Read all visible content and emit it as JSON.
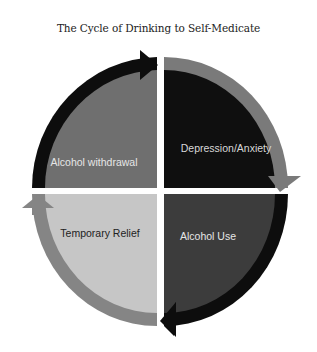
{
  "title": "The Cycle of Drinking to Self-Medicate",
  "quadrants": [
    {
      "position": "top-left",
      "label": "Alcohol withdrawal",
      "fill": "#6f6f6f",
      "text_color": "#e6e6e6",
      "arc_color": "#0d0d0d"
    },
    {
      "position": "top-right",
      "label": "Depression/Anxiety",
      "fill": "#0f0f0f",
      "text_color": "#d8d8d8",
      "arc_color": "#7a7a7a"
    },
    {
      "position": "bottom-right",
      "label": "Alcohol Use",
      "fill": "#3c3c3c",
      "text_color": "#e6e6e6",
      "arc_color": "#0d0d0d"
    },
    {
      "position": "bottom-left",
      "label": "Temporary Relief",
      "fill": "#c6c6c6",
      "text_color": "#222222",
      "arc_color": "#858585"
    }
  ],
  "cycle_order": [
    "Alcohol withdrawal",
    "Depression/Anxiety",
    "Alcohol Use",
    "Temporary Relief"
  ]
}
